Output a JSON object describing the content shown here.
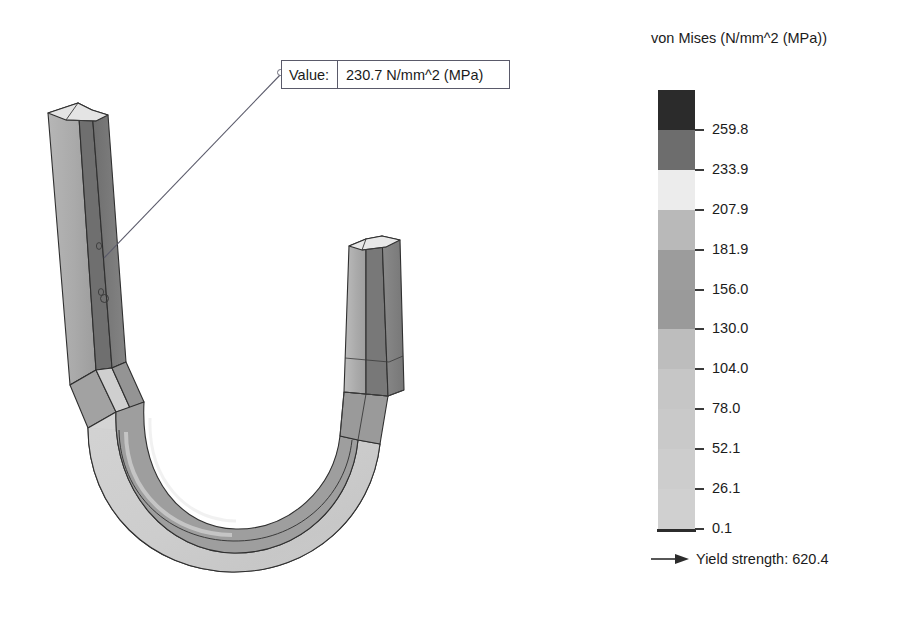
{
  "callout": {
    "label": "Value:",
    "value": "230.7 N/mm^2 (MPa)"
  },
  "legend": {
    "title": "von Mises (N/mm^2 (MPa))",
    "ticks": [
      "259.8",
      "233.9",
      "207.9",
      "181.9",
      "156.0",
      "130.0",
      "104.0",
      "78.0",
      "52.1",
      "26.1",
      "0.1"
    ],
    "band_colors": [
      "#2b2b2b",
      "#6d6d6d",
      "#ececec",
      "#b9b9b9",
      "#9c9c9c",
      "#9a9a9a",
      "#bdbdbd",
      "#c6c6c6",
      "#c9c9c9",
      "#cdcdcd",
      "#d0d0d0"
    ],
    "yield_label": "Yield strength: 620.4"
  },
  "chart_data": {
    "type": "heatmap",
    "title": "von Mises (N/mm^2 (MPa))",
    "units": "N/mm^2 (MPa)",
    "colorbar_min": 0.1,
    "colorbar_max": 259.8,
    "tick_values": [
      259.8,
      233.9,
      207.9,
      181.9,
      156.0,
      130.0,
      104.0,
      78.0,
      52.1,
      26.1,
      0.1
    ],
    "band_colors": [
      "#2b2b2b",
      "#6d6d6d",
      "#ececec",
      "#b9b9b9",
      "#9c9c9c",
      "#9a9a9a",
      "#bdbdbd",
      "#c6c6c6",
      "#c9c9c9",
      "#cdcdcd",
      "#d0d0d0"
    ],
    "annotations": [
      {
        "label": "Value:",
        "value": 230.7,
        "units": "N/mm^2 (MPa)",
        "text": "230.7 N/mm^2 (MPa)"
      },
      {
        "label": "Yield strength",
        "value": 620.4,
        "text": "Yield strength: 620.4"
      }
    ],
    "legend_position": "right",
    "grid": false
  }
}
